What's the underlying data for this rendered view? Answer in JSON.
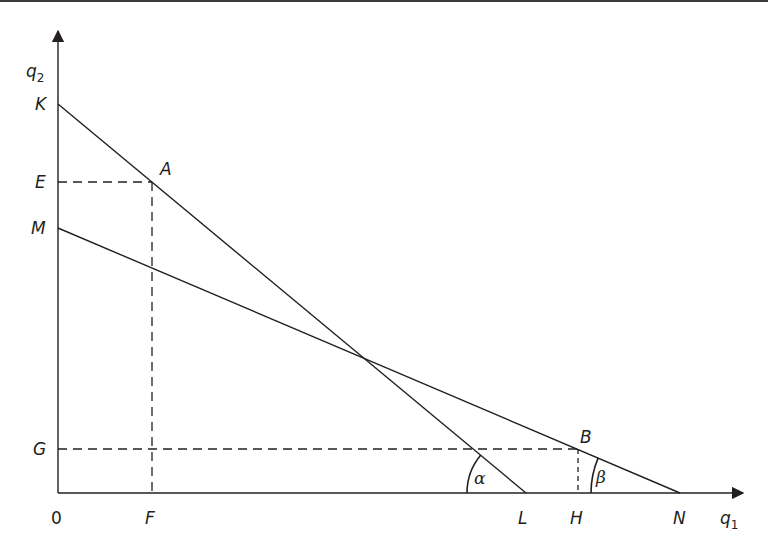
{
  "figure": {
    "type": "quantity-space diagram",
    "colors": {
      "ink": "#231f20",
      "background": "#ffffff",
      "top_rule": "#3a3a3a"
    },
    "axes": {
      "x_label": "q",
      "x_label_sub": "1",
      "y_label": "q",
      "y_label_sub": "2",
      "origin_label": "0"
    },
    "y_axis_points": {
      "K": "K",
      "E": "E",
      "M": "M",
      "G": "G"
    },
    "x_axis_points": {
      "F": "F",
      "L": "L",
      "H": "H",
      "N": "N"
    },
    "curve_points": {
      "A": "A",
      "B": "B"
    },
    "lines": [
      {
        "name": "KL",
        "from": "K",
        "to": "L",
        "style": "solid"
      },
      {
        "name": "MN",
        "from": "M",
        "to": "N",
        "style": "solid"
      },
      {
        "name": "EA",
        "from": "E",
        "to": "A",
        "style": "dashed"
      },
      {
        "name": "AF",
        "from": "A",
        "to": "F",
        "style": "dashed"
      },
      {
        "name": "GB",
        "from": "G",
        "to": "B",
        "style": "dashed"
      },
      {
        "name": "BH",
        "from": "B",
        "to": "H",
        "style": "dashed"
      }
    ],
    "angles": {
      "alpha": "α",
      "beta": "β"
    }
  }
}
